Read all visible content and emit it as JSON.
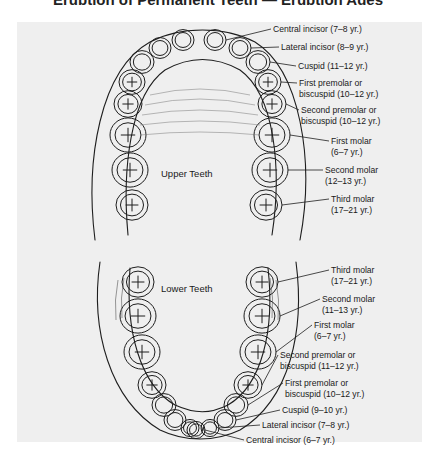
{
  "title": "Eruption of Permanent Teeth — Eruption Ages",
  "arch_labels": {
    "upper": "Upper Teeth",
    "lower": "Lower Teeth"
  },
  "upper_teeth": [
    {
      "line1": "Central incisor (7–8 yr.)",
      "line2": ""
    },
    {
      "line1": "Lateral incisor (8–9 yr.)",
      "line2": ""
    },
    {
      "line1": "Cuspid (11–12 yr.)",
      "line2": ""
    },
    {
      "line1": "First premolar or",
      "line2": "biscuspid (10–12 yr.)"
    },
    {
      "line1": "Second premolar or",
      "line2": "biscuspid (10–12 yr.)"
    },
    {
      "line1": "First molar",
      "line2": "(6–7 yr.)"
    },
    {
      "line1": "Second molar",
      "line2": "(12–13 yr.)"
    },
    {
      "line1": "Third molar",
      "line2": "(17–21 yr.)"
    }
  ],
  "lower_teeth": [
    {
      "line1": "Third molar",
      "line2": "(17–21 yr.)"
    },
    {
      "line1": "Second molar",
      "line2": "(11–13 yr.)"
    },
    {
      "line1": "First molar",
      "line2": "(6–7 yr.)"
    },
    {
      "line1": "Second premolar or",
      "line2": "biscuspid (11–12 yr.)"
    },
    {
      "line1": "First premolar or",
      "line2": "biscuspid (10–12 yr.)"
    },
    {
      "line1": "Cuspid (9–10 yr.)",
      "line2": ""
    },
    {
      "line1": "Lateral incisor (7–8 yr.)",
      "line2": ""
    },
    {
      "line1": "Central incisor (6–7 yr.)",
      "line2": ""
    }
  ]
}
